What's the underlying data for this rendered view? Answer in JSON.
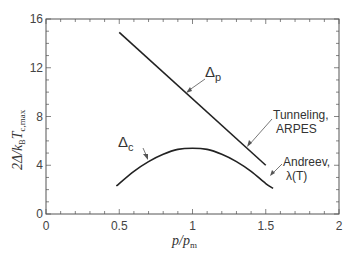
{
  "chart_data": {
    "type": "line",
    "title": "",
    "xlabel": "p/p_m",
    "ylabel": "2Δ/k_B T_c,max",
    "xlim": [
      0,
      2
    ],
    "ylim": [
      0,
      16
    ],
    "xticks": [
      "0",
      "0.5",
      "1",
      "1.5",
      "2"
    ],
    "yticks": [
      "0",
      "4",
      "8",
      "12",
      "16"
    ],
    "grid": false,
    "legend": "none (inline annotations)",
    "series": [
      {
        "name": "Δp",
        "annotation": "Tunneling, ARPES",
        "x": [
          0.5,
          1.5
        ],
        "y": [
          14.9,
          4.0
        ]
      },
      {
        "name": "Δc",
        "annotation": "Andreev, λ(T)",
        "x": [
          0.48,
          0.6,
          0.7,
          0.8,
          0.9,
          1.0,
          1.1,
          1.2,
          1.3,
          1.4,
          1.5,
          1.55
        ],
        "y": [
          2.3,
          3.5,
          4.3,
          4.9,
          5.3,
          5.4,
          5.3,
          4.9,
          4.3,
          3.5,
          2.5,
          2.1
        ]
      }
    ],
    "annotations": {
      "delta_p": {
        "symbol": "Δ",
        "sub": "p"
      },
      "delta_c": {
        "symbol": "Δ",
        "sub": "c"
      },
      "tunneling_line1": "Tunneling,",
      "tunneling_line2": "ARPES",
      "andreev_line1": "Andreev,",
      "andreev_line2": "λ(T)"
    },
    "axis_labels": {
      "x_main": "p/p",
      "x_sub": "m",
      "y_main": "2Δ/k",
      "y_sub1": "B",
      "y_mid": "T",
      "y_sub2": "c,max"
    }
  }
}
